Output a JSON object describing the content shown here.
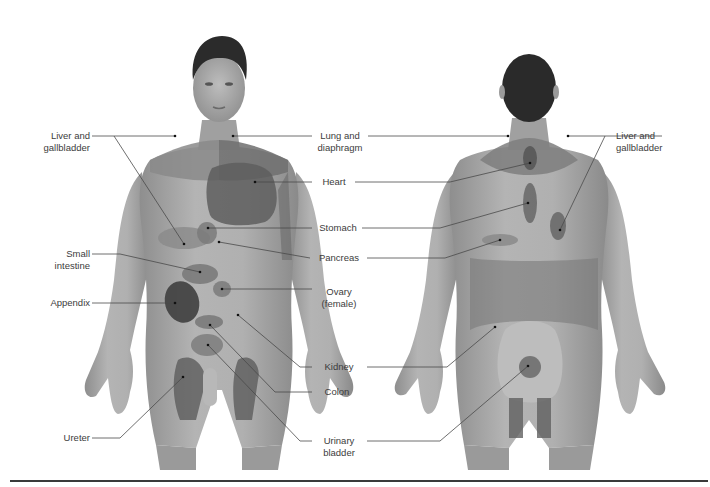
{
  "diagram": {
    "colors": {
      "skin": "#a8a8a8",
      "skin_light": "#c4c4c4",
      "referred_zone": "#8d8d8d",
      "referred_zone_dark": "#5e5e5e",
      "hair": "#2a2a2a",
      "leader_line": "#4a4a4a",
      "text": "#3c3c3c",
      "bottom_rule": "#3a3a3a"
    },
    "views": [
      {
        "name": "anterior",
        "label": "Front view"
      },
      {
        "name": "posterior",
        "label": "Back view"
      }
    ],
    "labels": {
      "liver_front": {
        "line1": "Liver and",
        "line2": "gallbladder"
      },
      "small_intestine": {
        "line1": "Small",
        "line2": "intestine"
      },
      "appendix": {
        "line1": "Appendix"
      },
      "ureter": {
        "line1": "Ureter"
      },
      "lung": {
        "line1": "Lung and",
        "line2": "diaphragm"
      },
      "heart": {
        "line1": "Heart"
      },
      "stomach": {
        "line1": "Stomach"
      },
      "pancreas": {
        "line1": "Pancreas"
      },
      "ovary": {
        "line1": "Ovary",
        "line2": "(female)"
      },
      "kidney": {
        "line1": "Kidney"
      },
      "colon": {
        "line1": "Colon"
      },
      "urinary_bladder": {
        "line1": "Urinary",
        "line2": "bladder"
      },
      "liver_back": {
        "line1": "Liver and",
        "line2": "gallbladder"
      }
    }
  }
}
